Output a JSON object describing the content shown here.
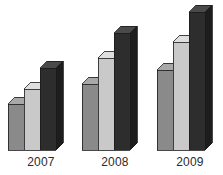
{
  "chart_data": {
    "type": "bar",
    "title": "",
    "subtitle": "",
    "xlabel": "",
    "ylabel": "",
    "categories": [
      "2007",
      "2008",
      "2009"
    ],
    "series": [
      {
        "name": "Series 1",
        "color": "#8a8a8a",
        "values": [
          46,
          66,
          80
        ]
      },
      {
        "name": "Series 2",
        "color": "#c9c9c9",
        "values": [
          61,
          92,
          108
        ]
      },
      {
        "name": "Series 3",
        "color": "#2d2d2d",
        "values": [
          82,
          117,
          138
        ]
      }
    ],
    "ylim": [
      0,
      150
    ],
    "grid": false,
    "legend": "none",
    "style": "3d-clustered-column",
    "background": "#ffffff"
  },
  "axis": {
    "baseline_visible": false,
    "tick_labels": [
      "2007",
      "2008",
      "2009"
    ]
  },
  "geometry": {
    "baseline_y": 150,
    "depth_x": 7,
    "depth_y": 7,
    "bar_width": 16,
    "bar_gap": 0,
    "groups": [
      {
        "label": "2007",
        "x": 8,
        "label_center": 41
      },
      {
        "label": "2008",
        "x": 82,
        "label_center": 115
      },
      {
        "label": "2009",
        "x": 157,
        "label_center": 190
      }
    ],
    "bar_tops": [
      [
        104,
        89,
        68
      ],
      [
        84,
        58,
        33
      ],
      [
        70,
        42,
        12
      ]
    ]
  },
  "colors": {
    "series1_front": "#8a8a8a",
    "series1_top": "#a8a8a8",
    "series1_side": "#6e6e6e",
    "series2_front": "#c9c9c9",
    "series2_top": "#dedede",
    "series2_side": "#a9a9a9",
    "series3_front": "#2d2d2d",
    "series3_top": "#4a4a4a",
    "series3_side": "#1d1d1d",
    "outline": "#1a1a1a",
    "label_text": "#2b2b2b",
    "background": "#ffffff"
  }
}
